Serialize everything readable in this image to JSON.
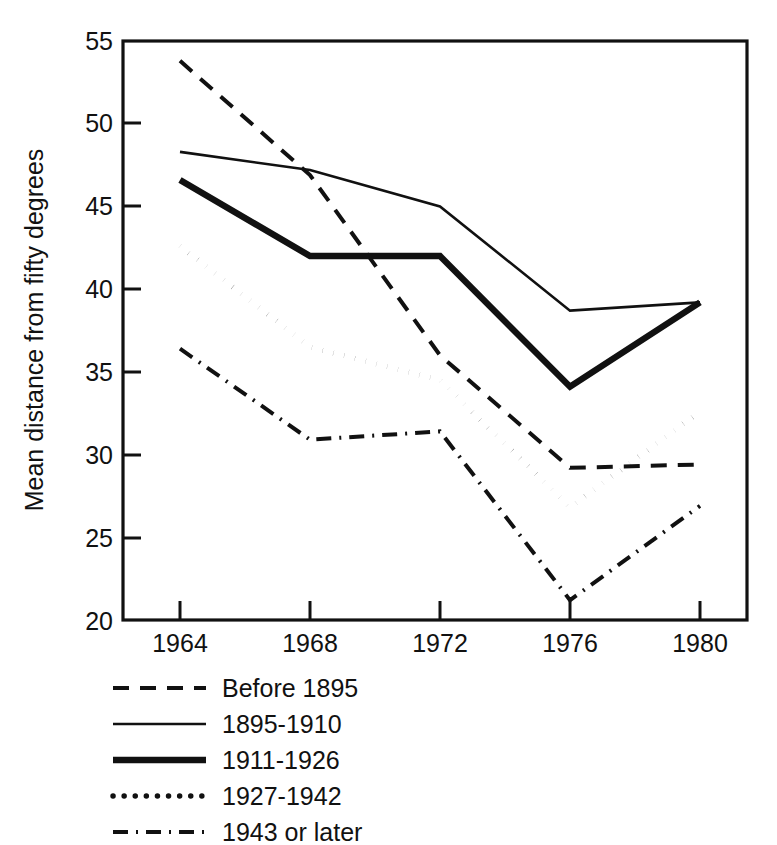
{
  "chart_data": {
    "type": "line",
    "title": "",
    "xlabel": "",
    "ylabel": "Mean distance from fifty degrees",
    "x": [
      1964,
      1968,
      1972,
      1976,
      1980
    ],
    "xticklabels": [
      "1964",
      "1968",
      "1972",
      "1976",
      "1980"
    ],
    "yticks": [
      20,
      25,
      30,
      35,
      40,
      45,
      50,
      55
    ],
    "yticklabels": [
      "20",
      "25",
      "30",
      "35",
      "40",
      "45",
      "50",
      "55"
    ],
    "xlim": [
      1962,
      1982
    ],
    "ylim": [
      20,
      55
    ],
    "grid": false,
    "legend_position": "below-left",
    "series": [
      {
        "name": "Before 1895",
        "style": "dashed",
        "values": [
          53.8,
          46.9,
          36.0,
          29.2,
          29.4
        ]
      },
      {
        "name": "1895-1910",
        "style": "thin-solid",
        "values": [
          48.3,
          47.2,
          45.0,
          38.7,
          39.2
        ]
      },
      {
        "name": "1911-1926",
        "style": "thick-solid",
        "values": [
          46.6,
          42.0,
          42.0,
          34.1,
          39.2
        ]
      },
      {
        "name": "1927-1942",
        "style": "dotted",
        "values": [
          42.6,
          36.5,
          34.5,
          26.8,
          32.6
        ]
      },
      {
        "name": "1943 or later",
        "style": "dash-dot",
        "values": [
          36.4,
          30.9,
          31.4,
          21.2,
          26.9
        ]
      }
    ]
  },
  "axis": {
    "ylabel": "Mean distance from fifty degrees",
    "ytick_labels": [
      "55",
      "50",
      "45",
      "40",
      "35",
      "30",
      "25",
      "20"
    ],
    "xtick_labels": [
      "1964",
      "1968",
      "1972",
      "1976",
      "1980"
    ]
  },
  "legend": {
    "items": [
      {
        "label": "Before 1895",
        "style": "dashed"
      },
      {
        "label": "1895-1910",
        "style": "thin-solid"
      },
      {
        "label": "1911-1926",
        "style": "thick-solid"
      },
      {
        "label": "1927-1942",
        "style": "dotted"
      },
      {
        "label": "1943 or later",
        "style": "dash-dot"
      }
    ]
  },
  "colors": {
    "ink": "#111111",
    "background": "#ffffff"
  }
}
